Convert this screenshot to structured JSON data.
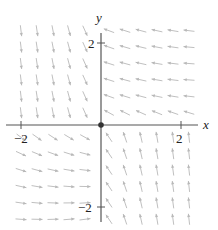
{
  "figure": {
    "type": "vector_field",
    "axes": {
      "x_label": "x",
      "y_label": "y",
      "x_ticks": [
        {
          "value": -2,
          "label": "−2"
        },
        {
          "value": 2,
          "label": "2"
        }
      ],
      "y_ticks": [
        {
          "value": 2,
          "label": "2"
        },
        {
          "value": -2,
          "label": "−2"
        }
      ],
      "x_range": [
        -2.4,
        2.3
      ],
      "y_range": [
        -2.3,
        2.3
      ]
    },
    "origin_marker": "filled-dot",
    "colors": {
      "axis": "#555555",
      "arrow": "#b8b8b8",
      "text": "#222222",
      "dot": "#333333"
    },
    "arrow_grid": {
      "columns": [
        -2.0,
        -1.6,
        -1.2,
        -0.8,
        -0.4,
        0.2,
        0.6,
        1.0,
        1.4,
        1.8,
        2.2
      ],
      "rows": [
        2.3,
        1.9,
        1.5,
        1.1,
        0.7,
        0.3,
        -0.3,
        -0.7,
        -1.1,
        -1.5,
        -1.9,
        -2.3
      ]
    },
    "quadrant_directions": {
      "top_left": "down",
      "top_right": "left",
      "bottom_left": "right",
      "bottom_right": "up"
    }
  }
}
